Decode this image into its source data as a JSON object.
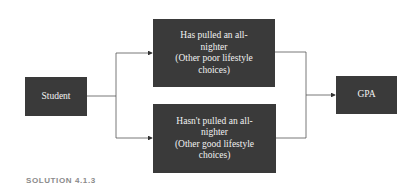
{
  "diagram": {
    "nodes": {
      "student": {
        "label": "Student"
      },
      "top": {
        "label": "Has pulled an all-\nnighter\n(Other poor lifestyle\nchoices)"
      },
      "bottom": {
        "label": "Hasn't pulled an all-\nnighter\n(Other good lifestyle\nchoices)"
      },
      "gpa": {
        "label": "GPA"
      }
    },
    "edges": [
      {
        "from": "student",
        "to": "top"
      },
      {
        "from": "student",
        "to": "bottom"
      },
      {
        "from": "top",
        "to": "gpa"
      },
      {
        "from": "bottom",
        "to": "gpa"
      }
    ],
    "colors": {
      "box": "#3a3a3a",
      "box_text": "#f2f2f2",
      "line": "#555555",
      "caption": "#8a8a8a"
    }
  },
  "caption": "SOLUTION 4.1.3"
}
